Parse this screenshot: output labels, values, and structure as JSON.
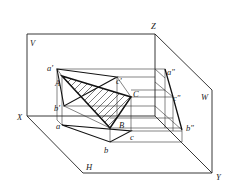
{
  "diagram": {
    "planes": {
      "V": "V",
      "H": "H",
      "W": "W"
    },
    "axes": {
      "X": "X",
      "Y": "Y",
      "Z": "Z"
    },
    "space_points": {
      "A": "A",
      "B": "B",
      "C": "C"
    },
    "v_projection": {
      "a": "a'",
      "b": "b'",
      "c": "c'"
    },
    "h_projection": {
      "a": "a",
      "b": "b",
      "c": "c"
    },
    "w_projection": {
      "a": "a\"",
      "b": "b\"",
      "c": "c\""
    },
    "colors": {
      "line": "#111111",
      "background": "#ffffff"
    }
  }
}
